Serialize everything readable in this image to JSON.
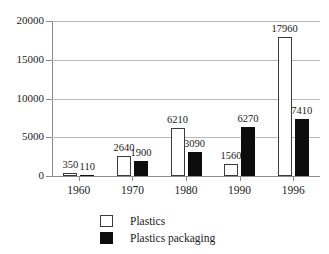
{
  "chart_data": {
    "type": "bar",
    "title": "",
    "subtitle": "",
    "xlabel": "",
    "ylabel": "",
    "categories": [
      "1960",
      "1970",
      "1980",
      "1990",
      "1996"
    ],
    "series": [
      {
        "name": "Plastics",
        "color": "#ffffff",
        "values": [
          350,
          2640,
          6210,
          1560,
          17960
        ],
        "labels": [
          "350",
          "2640",
          "6210",
          "1560",
          "17960"
        ]
      },
      {
        "name": "Plastics packaging",
        "color": "#000000",
        "values": [
          110,
          1900,
          3090,
          6270,
          7410
        ],
        "labels": [
          "110",
          "1900",
          "3090",
          "6270",
          "7410"
        ]
      }
    ],
    "ylim": [
      0,
      20000
    ],
    "yticks": [
      0,
      5000,
      10000,
      15000,
      20000
    ],
    "ytick_labels": [
      "0",
      "5000",
      "10000",
      "15000",
      "20000"
    ],
    "grid": true,
    "grid_axis": "y",
    "legend_position": "bottom",
    "legend": [
      {
        "label": "Plastics",
        "swatch": "light"
      },
      {
        "label": "Plastics packaging",
        "swatch": "dark"
      }
    ]
  },
  "colors": {
    "background": "#ffffff",
    "axis": "#8a8a8a",
    "grid": "#b9b9b9",
    "text": "#1a1a1a",
    "bar_light_fill": "#ffffff",
    "bar_light_edge": "#3a3a3a",
    "bar_dark_fill": "#0d0d0d"
  }
}
